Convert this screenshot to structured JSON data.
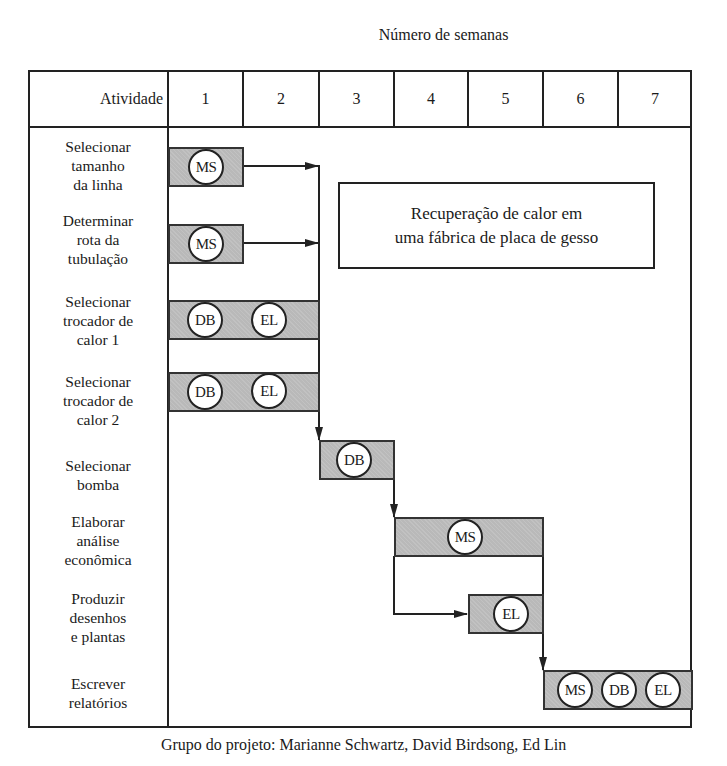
{
  "title": "Número de semanas",
  "header": {
    "activity_label": "Atividade",
    "weeks": [
      "1",
      "2",
      "3",
      "4",
      "5",
      "6",
      "7"
    ]
  },
  "activities": [
    {
      "label_lines": [
        "Selecionar",
        "tamanho",
        "da linha"
      ],
      "start_week": 1,
      "end_week": 1,
      "people": [
        "MS"
      ]
    },
    {
      "label_lines": [
        "Determinar",
        "rota da",
        "tubulação"
      ],
      "start_week": 1,
      "end_week": 1,
      "people": [
        "MS"
      ]
    },
    {
      "label_lines": [
        "Selecionar",
        "trocador de",
        "calor 1"
      ],
      "start_week": 1,
      "end_week": 2,
      "people": [
        "DB",
        "EL"
      ]
    },
    {
      "label_lines": [
        "Selecionar",
        "trocador de",
        "calor 2"
      ],
      "start_week": 1,
      "end_week": 2,
      "people": [
        "DB",
        "EL"
      ]
    },
    {
      "label_lines": [
        "Selecionar",
        "bomba"
      ],
      "start_week": 3,
      "end_week": 3,
      "people": [
        "DB"
      ]
    },
    {
      "label_lines": [
        "Elaborar",
        "análise",
        "econômica"
      ],
      "start_week": 4,
      "end_week": 5,
      "people": [
        "MS"
      ]
    },
    {
      "label_lines": [
        "Produzir",
        "desenhos",
        "e plantas"
      ],
      "start_week": 5,
      "end_week": 5,
      "people": [
        "EL"
      ]
    },
    {
      "label_lines": [
        "Escrever",
        "relatórios"
      ],
      "start_week": 6,
      "end_week": 7,
      "people": [
        "MS",
        "DB",
        "EL"
      ]
    }
  ],
  "note": {
    "line1": "Recuperação de calor em",
    "line2": "uma fábrica de placa de gesso"
  },
  "caption": "Grupo do projeto: Marianne Schwartz, David Birdsong, Ed Lin",
  "colors": {
    "bar_fill": "#b9b9b9",
    "line": "#222222"
  }
}
